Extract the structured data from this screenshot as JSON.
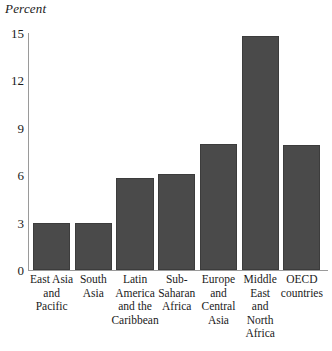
{
  "chart_data": {
    "type": "bar",
    "title": "",
    "subtitle": "",
    "xlabel": "",
    "ylabel": "Percent",
    "ylim": [
      0,
      15
    ],
    "yticks": [
      0,
      3,
      6,
      9,
      12,
      15
    ],
    "ytick_labels": [
      "0",
      "3",
      "6",
      "9",
      "12",
      "15"
    ],
    "grid": false,
    "legend": null,
    "bar_color": "#4a4a4a",
    "axis_color": "#9a9a9a",
    "categories": [
      "East Asia and Pacific",
      "South Asia",
      "Latin America and the Caribbean",
      "Sub-Saharan Africa",
      "Europe and Central Asia",
      "Middle East and North Africa",
      "OECD countries"
    ],
    "category_lines": [
      [
        "East Asia",
        "and",
        "Pacific"
      ],
      [
        "South",
        "Asia"
      ],
      [
        "Latin",
        "America",
        "and the",
        "Caribbean"
      ],
      [
        "Sub-",
        "Saharan",
        "Africa"
      ],
      [
        "Europe",
        "and",
        "Central",
        "Asia"
      ],
      [
        "Middle",
        "East",
        "and",
        "North",
        "Africa"
      ],
      [
        "OECD",
        "countries"
      ]
    ],
    "values": [
      2.95,
      3.0,
      5.85,
      6.1,
      7.95,
      14.8,
      7.9
    ],
    "series": [
      {
        "name": "Percent",
        "values": [
          2.95,
          3.0,
          5.85,
          6.1,
          7.95,
          14.8,
          7.9
        ]
      }
    ]
  },
  "axis": {
    "unit_label": "Percent"
  }
}
